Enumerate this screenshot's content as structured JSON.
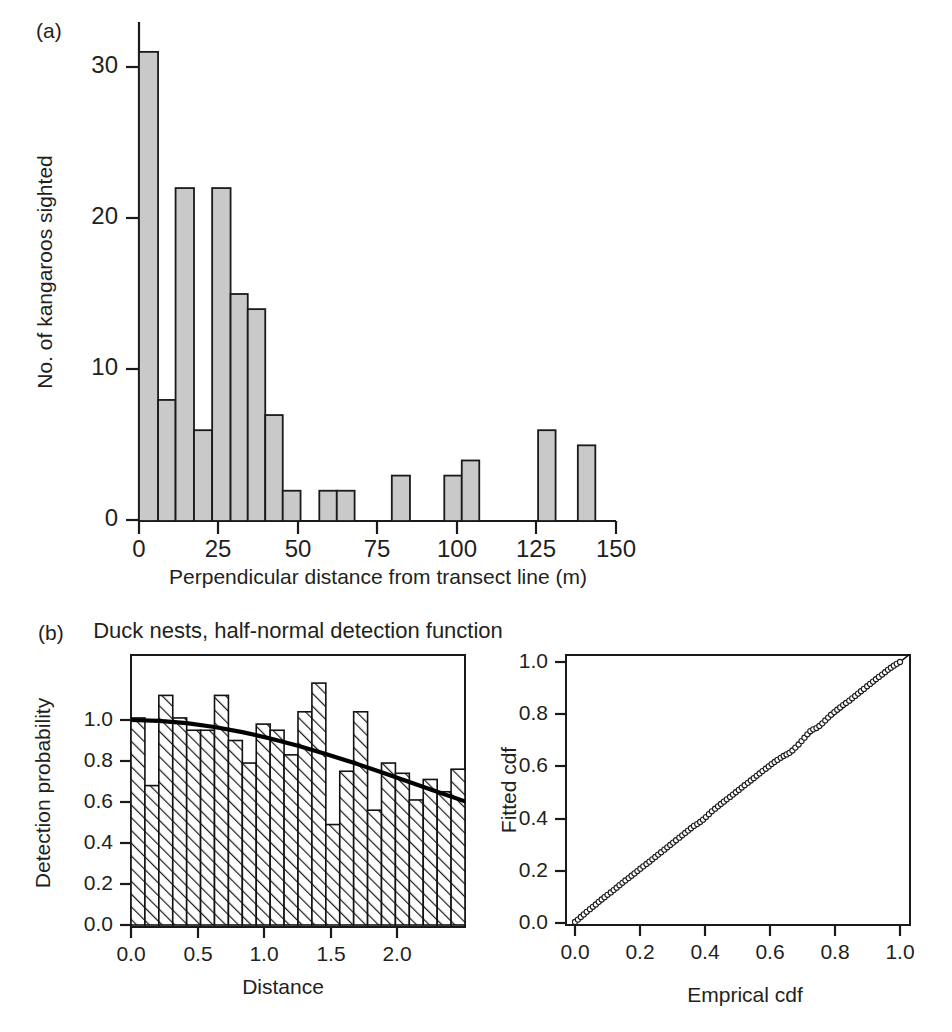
{
  "figure": {
    "panel_a_label": "(a)",
    "panel_b_label": "(b)"
  },
  "panel_a": {
    "ylabel": "No. of kangaroos sighted",
    "xlabel": "Perpendicular distance from transect line (m)",
    "y_ticks": [
      "0",
      "10",
      "20",
      "30"
    ],
    "x_ticks": [
      "0",
      "25",
      "50",
      "75",
      "100",
      "125",
      "150"
    ],
    "bar_fill": "#c9c9c9",
    "bar_edge": "#1a1a1a"
  },
  "panel_b_left": {
    "title": "Duck nests, half-normal detection function",
    "ylabel": "Detection probability",
    "xlabel": "Distance",
    "y_ticks": [
      "0.0",
      "0.2",
      "0.4",
      "0.6",
      "0.8",
      "1.0"
    ],
    "x_ticks": [
      "0.0",
      "0.5",
      "1.0",
      "1.5",
      "2.0"
    ],
    "bar_fill": "hatch-45-degree",
    "curve_color": "#000000"
  },
  "panel_b_right": {
    "ylabel": "Fitted cdf",
    "xlabel": "Emprical cdf",
    "y_ticks": [
      "0.0",
      "0.2",
      "0.4",
      "0.6",
      "0.8",
      "1.0"
    ],
    "x_ticks": [
      "0.0",
      "0.2",
      "0.4",
      "0.6",
      "0.8",
      "1.0"
    ],
    "marker": "open-circle",
    "reference_line": "y = x"
  },
  "chart_data": [
    {
      "type": "bar",
      "id": "kangaroo-histogram",
      "title": "",
      "panel": "(a)",
      "xlabel": "Perpendicular distance from transect line (m)",
      "ylabel": "No. of kangaroos sighted",
      "xlim": [
        -3,
        152
      ],
      "ylim": [
        0,
        32
      ],
      "xticks": [
        0,
        25,
        50,
        75,
        100,
        125,
        150
      ],
      "yticks": [
        0,
        10,
        20,
        30
      ],
      "grid": false,
      "bin_width": 6.2,
      "bins": [
        {
          "x0": 0.0,
          "x1": 6.2,
          "value": 31
        },
        {
          "x0": 6.2,
          "x1": 12.4,
          "value": 8
        },
        {
          "x0": 12.4,
          "x1": 18.6,
          "value": 22
        },
        {
          "x0": 18.6,
          "x1": 24.8,
          "value": 6
        },
        {
          "x0": 24.8,
          "x1": 31.0,
          "value": 22
        },
        {
          "x0": 31.0,
          "x1": 37.2,
          "value": 15
        },
        {
          "x0": 37.2,
          "x1": 43.4,
          "value": 14
        },
        {
          "x0": 43.4,
          "x1": 49.6,
          "value": 7
        },
        {
          "x0": 49.6,
          "x1": 55.8,
          "value": 2
        },
        {
          "x0": 55.8,
          "x1": 62.0,
          "value": 0
        },
        {
          "x0": 62.0,
          "x1": 68.2,
          "value": 0
        },
        {
          "x0": 68.2,
          "x1": 74.4,
          "value": 2
        },
        {
          "x0": 74.4,
          "x1": 80.6,
          "value": 2
        },
        {
          "x0": 80.6,
          "x1": 86.8,
          "value": 0
        },
        {
          "x0": 86.8,
          "x1": 93.0,
          "value": 0
        },
        {
          "x0": 93.0,
          "x1": 99.2,
          "value": 3
        },
        {
          "x0": 99.2,
          "x1": 105.4,
          "value": 0
        },
        {
          "x0": 105.4,
          "x1": 111.6,
          "value": 3
        },
        {
          "x0": 111.6,
          "x1": 117.8,
          "value": 4
        },
        {
          "x0": 117.8,
          "x1": 124.0,
          "value": 0
        },
        {
          "x0": 124.0,
          "x1": 130.2,
          "value": 0
        },
        {
          "x0": 130.2,
          "x1": 136.4,
          "value": 6
        },
        {
          "x0": 136.4,
          "x1": 142.6,
          "value": 0
        },
        {
          "x0": 142.6,
          "x1": 148.8,
          "value": 5
        }
      ],
      "drawn_bars": [
        {
          "x0": 0.0,
          "x1": 6.0,
          "value": 31
        },
        {
          "x0": 6.0,
          "x1": 11.5,
          "value": 8
        },
        {
          "x0": 11.5,
          "x1": 17.3,
          "value": 22
        },
        {
          "x0": 17.3,
          "x1": 23.0,
          "value": 6
        },
        {
          "x0": 23.0,
          "x1": 28.8,
          "value": 22
        },
        {
          "x0": 28.8,
          "x1": 34.2,
          "value": 15
        },
        {
          "x0": 34.2,
          "x1": 39.7,
          "value": 14
        },
        {
          "x0": 39.7,
          "x1": 45.2,
          "value": 7
        },
        {
          "x0": 45.2,
          "x1": 50.8,
          "value": 2
        },
        {
          "x0": 56.7,
          "x1": 62.2,
          "value": 2
        },
        {
          "x0": 62.2,
          "x1": 67.8,
          "value": 2
        },
        {
          "x0": 79.5,
          "x1": 85.2,
          "value": 3
        },
        {
          "x0": 96.0,
          "x1": 101.5,
          "value": 3
        },
        {
          "x0": 101.5,
          "x1": 107.0,
          "value": 4
        },
        {
          "x0": 125.5,
          "x1": 131.0,
          "value": 6
        },
        {
          "x0": 138.0,
          "x1": 143.5,
          "value": 5
        }
      ]
    },
    {
      "type": "bar",
      "id": "duck-nests-detection",
      "title": "Duck nests, half-normal detection function",
      "panel": "(b) left",
      "xlabel": "Distance",
      "ylabel": "Detection probability",
      "xlim": [
        0.0,
        2.4
      ],
      "ylim": [
        0.0,
        1.22
      ],
      "xticks": [
        0.0,
        0.5,
        1.0,
        1.5,
        2.0
      ],
      "yticks": [
        0.0,
        0.2,
        0.4,
        0.6,
        0.8,
        1.0
      ],
      "grid": false,
      "bin_width": 0.1,
      "categories": [
        0.05,
        0.15,
        0.25,
        0.35,
        0.45,
        0.55,
        0.65,
        0.75,
        0.85,
        0.95,
        1.05,
        1.15,
        1.25,
        1.35,
        1.45,
        1.55,
        1.65,
        1.75,
        1.85,
        1.95,
        2.05,
        2.15,
        2.25,
        2.35
      ],
      "values": [
        1.01,
        0.68,
        1.12,
        1.01,
        0.95,
        0.95,
        1.12,
        0.9,
        0.79,
        0.98,
        0.95,
        0.83,
        1.04,
        1.18,
        0.49,
        0.75,
        1.04,
        0.56,
        0.79,
        0.74,
        0.61,
        0.71,
        0.65,
        0.76
      ],
      "series": [
        {
          "name": "half-normal fitted detection function",
          "type": "line",
          "x": [
            0.0,
            0.2,
            0.4,
            0.6,
            0.8,
            1.0,
            1.2,
            1.4,
            1.6,
            1.8,
            2.0,
            2.2,
            2.4
          ],
          "y": [
            1.0,
            0.996,
            0.985,
            0.966,
            0.941,
            0.91,
            0.874,
            0.834,
            0.791,
            0.745,
            0.698,
            0.65,
            0.603
          ]
        }
      ]
    },
    {
      "type": "scatter",
      "id": "qq-cdf-plot",
      "title": "",
      "panel": "(b) right",
      "xlabel": "Emprical cdf",
      "ylabel": "Fitted cdf",
      "xlim": [
        -0.02,
        1.04
      ],
      "ylim": [
        -0.02,
        1.04
      ],
      "xticks": [
        0.0,
        0.2,
        0.4,
        0.6,
        0.8,
        1.0
      ],
      "yticks": [
        0.0,
        0.2,
        0.4,
        0.6,
        0.8,
        1.0
      ],
      "grid": false,
      "reference_line": {
        "slope": 1,
        "intercept": 0
      },
      "points": [
        [
          0.0,
          0.004
        ],
        [
          0.009,
          0.013
        ],
        [
          0.018,
          0.023
        ],
        [
          0.027,
          0.033
        ],
        [
          0.036,
          0.043
        ],
        [
          0.046,
          0.053
        ],
        [
          0.055,
          0.062
        ],
        [
          0.064,
          0.071
        ],
        [
          0.073,
          0.081
        ],
        [
          0.082,
          0.09
        ],
        [
          0.091,
          0.099
        ],
        [
          0.1,
          0.108
        ],
        [
          0.11,
          0.117
        ],
        [
          0.119,
          0.126
        ],
        [
          0.128,
          0.135
        ],
        [
          0.137,
          0.145
        ],
        [
          0.146,
          0.154
        ],
        [
          0.155,
          0.163
        ],
        [
          0.165,
          0.172
        ],
        [
          0.174,
          0.181
        ],
        [
          0.183,
          0.19
        ],
        [
          0.192,
          0.199
        ],
        [
          0.201,
          0.208
        ],
        [
          0.21,
          0.217
        ],
        [
          0.22,
          0.226
        ],
        [
          0.229,
          0.235
        ],
        [
          0.238,
          0.244
        ],
        [
          0.247,
          0.253
        ],
        [
          0.256,
          0.262
        ],
        [
          0.265,
          0.271
        ],
        [
          0.275,
          0.281
        ],
        [
          0.284,
          0.29
        ],
        [
          0.293,
          0.299
        ],
        [
          0.302,
          0.308
        ],
        [
          0.311,
          0.317
        ],
        [
          0.321,
          0.327
        ],
        [
          0.33,
          0.336
        ],
        [
          0.339,
          0.345
        ],
        [
          0.348,
          0.354
        ],
        [
          0.357,
          0.363
        ],
        [
          0.366,
          0.372
        ],
        [
          0.376,
          0.379
        ],
        [
          0.385,
          0.387
        ],
        [
          0.394,
          0.396
        ],
        [
          0.403,
          0.406
        ],
        [
          0.412,
          0.417
        ],
        [
          0.421,
          0.428
        ],
        [
          0.431,
          0.438
        ],
        [
          0.44,
          0.447
        ],
        [
          0.449,
          0.456
        ],
        [
          0.458,
          0.465
        ],
        [
          0.467,
          0.474
        ],
        [
          0.477,
          0.483
        ],
        [
          0.486,
          0.492
        ],
        [
          0.495,
          0.501
        ],
        [
          0.504,
          0.51
        ],
        [
          0.513,
          0.519
        ],
        [
          0.522,
          0.528
        ],
        [
          0.532,
          0.537
        ],
        [
          0.541,
          0.546
        ],
        [
          0.55,
          0.555
        ],
        [
          0.559,
          0.564
        ],
        [
          0.568,
          0.573
        ],
        [
          0.577,
          0.582
        ],
        [
          0.587,
          0.591
        ],
        [
          0.596,
          0.6
        ],
        [
          0.605,
          0.609
        ],
        [
          0.614,
          0.617
        ],
        [
          0.623,
          0.625
        ],
        [
          0.633,
          0.633
        ],
        [
          0.642,
          0.64
        ],
        [
          0.651,
          0.646
        ],
        [
          0.66,
          0.652
        ],
        [
          0.669,
          0.661
        ],
        [
          0.678,
          0.672
        ],
        [
          0.688,
          0.684
        ],
        [
          0.697,
          0.697
        ],
        [
          0.706,
          0.71
        ],
        [
          0.715,
          0.723
        ],
        [
          0.724,
          0.735
        ],
        [
          0.733,
          0.742
        ],
        [
          0.743,
          0.747
        ],
        [
          0.752,
          0.755
        ],
        [
          0.761,
          0.765
        ],
        [
          0.77,
          0.776
        ],
        [
          0.779,
          0.787
        ],
        [
          0.788,
          0.798
        ],
        [
          0.798,
          0.808
        ],
        [
          0.807,
          0.817
        ],
        [
          0.816,
          0.826
        ],
        [
          0.825,
          0.835
        ],
        [
          0.834,
          0.843
        ],
        [
          0.844,
          0.852
        ],
        [
          0.853,
          0.861
        ],
        [
          0.862,
          0.87
        ],
        [
          0.871,
          0.879
        ],
        [
          0.88,
          0.888
        ],
        [
          0.889,
          0.897
        ],
        [
          0.899,
          0.907
        ],
        [
          0.908,
          0.916
        ],
        [
          0.917,
          0.925
        ],
        [
          0.926,
          0.934
        ],
        [
          0.935,
          0.943
        ],
        [
          0.945,
          0.952
        ],
        [
          0.954,
          0.961
        ],
        [
          0.963,
          0.97
        ],
        [
          0.972,
          0.978
        ],
        [
          0.981,
          0.986
        ],
        [
          0.99,
          0.993
        ],
        [
          1.0,
          1.0
        ]
      ]
    }
  ]
}
